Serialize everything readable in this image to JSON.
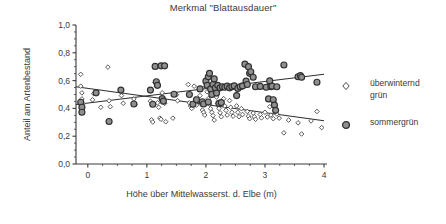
{
  "chart_data": {
    "type": "scatter",
    "title": "Merkmal \"Blattausdauer\"",
    "xlabel": "Höhe über Mittelwasserst. d. Elbe (m)",
    "ylabel": "Anteil am Artenbestand",
    "xlim": [
      -0.2,
      4.05
    ],
    "ylim": [
      0.0,
      1.0
    ],
    "xticks": [
      0,
      1,
      2,
      3,
      4
    ],
    "xtick_labels": [
      "0",
      "1",
      "2",
      "3",
      "4"
    ],
    "yticks": [
      0.0,
      0.2,
      0.4,
      0.6,
      0.8,
      1.0
    ],
    "ytick_labels": [
      "0,0",
      "0,2",
      "0,4",
      "0,6",
      "0,8",
      "1,0"
    ],
    "x_minor_step": 0.25,
    "y_minor_step": 0.05,
    "grid": false,
    "legend_position": "right",
    "series": [
      {
        "name": "überwinternd grün",
        "marker": "open-diamond",
        "marker_size": 4.2,
        "color": "#ffffff",
        "edge_color": "#4a4a4a",
        "trend": {
          "x0": -0.2,
          "y0": 0.556,
          "x1": 4.0,
          "y1": 0.311
        },
        "points": [
          [
            -0.12,
            0.645
          ],
          [
            -0.12,
            0.56
          ],
          [
            -0.1,
            0.512
          ],
          [
            -0.1,
            0.468
          ],
          [
            -0.08,
            0.432
          ],
          [
            0.08,
            0.462
          ],
          [
            0.1,
            0.506
          ],
          [
            0.34,
            0.697
          ],
          [
            0.36,
            0.455
          ],
          [
            0.38,
            0.412
          ],
          [
            0.57,
            0.492
          ],
          [
            0.6,
            0.437
          ],
          [
            0.78,
            0.468
          ],
          [
            0.8,
            0.43
          ],
          [
            1.06,
            0.452
          ],
          [
            1.08,
            0.318
          ],
          [
            1.1,
            0.302
          ],
          [
            1.14,
            0.585
          ],
          [
            1.16,
            0.56
          ],
          [
            1.18,
            0.44
          ],
          [
            1.2,
            0.408
          ],
          [
            1.22,
            0.33
          ],
          [
            1.24,
            0.322
          ],
          [
            1.26,
            0.512
          ],
          [
            1.28,
            0.47
          ],
          [
            1.3,
            0.436
          ],
          [
            1.32,
            0.304
          ],
          [
            1.5,
            0.498
          ],
          [
            1.52,
            0.455
          ],
          [
            1.7,
            0.572
          ],
          [
            1.72,
            0.44
          ],
          [
            1.74,
            0.418
          ],
          [
            1.76,
            0.4
          ],
          [
            1.8,
            0.56
          ],
          [
            1.82,
            0.468
          ],
          [
            1.84,
            0.424
          ],
          [
            1.9,
            0.492
          ],
          [
            1.92,
            0.43
          ],
          [
            1.94,
            0.388
          ],
          [
            1.96,
            0.372
          ],
          [
            1.98,
            0.352
          ],
          [
            2.0,
            0.556
          ],
          [
            2.02,
            0.52
          ],
          [
            2.04,
            0.47
          ],
          [
            2.06,
            0.43
          ],
          [
            2.08,
            0.398
          ],
          [
            2.1,
            0.372
          ],
          [
            2.12,
            0.348
          ],
          [
            2.14,
            0.316
          ],
          [
            2.16,
            0.54
          ],
          [
            2.18,
            0.482
          ],
          [
            2.2,
            0.436
          ],
          [
            2.22,
            0.4
          ],
          [
            2.24,
            0.368
          ],
          [
            2.26,
            0.34
          ],
          [
            2.3,
            0.47
          ],
          [
            2.32,
            0.418
          ],
          [
            2.34,
            0.386
          ],
          [
            2.36,
            0.352
          ],
          [
            2.4,
            0.456
          ],
          [
            2.42,
            0.408
          ],
          [
            2.44,
            0.372
          ],
          [
            2.46,
            0.344
          ],
          [
            2.52,
            0.418
          ],
          [
            2.54,
            0.372
          ],
          [
            2.56,
            0.34
          ],
          [
            2.6,
            0.398
          ],
          [
            2.62,
            0.356
          ],
          [
            2.7,
            0.378
          ],
          [
            2.72,
            0.344
          ],
          [
            2.74,
            0.326
          ],
          [
            2.8,
            0.366
          ],
          [
            2.82,
            0.34
          ],
          [
            2.84,
            0.322
          ],
          [
            2.92,
            0.356
          ],
          [
            2.94,
            0.332
          ],
          [
            3.0,
            0.372
          ],
          [
            3.04,
            0.338
          ],
          [
            3.08,
            0.412
          ],
          [
            3.1,
            0.352
          ],
          [
            3.14,
            0.326
          ],
          [
            3.2,
            0.36
          ],
          [
            3.24,
            0.33
          ],
          [
            3.32,
            0.224
          ],
          [
            3.4,
            0.316
          ],
          [
            3.56,
            0.296
          ],
          [
            3.62,
            0.216
          ],
          [
            3.78,
            0.31
          ],
          [
            3.88,
            0.378
          ],
          [
            3.96,
            0.262
          ],
          [
            0.22,
            0.408
          ],
          [
            1.44,
            0.33
          ]
        ]
      },
      {
        "name": "sommergrün",
        "marker": "filled-circle",
        "marker_size": 6.0,
        "color": "#8f8f8f",
        "edge_color": "#2f2f2f",
        "trend": {
          "x0": -0.2,
          "y0": 0.428,
          "x1": 4.0,
          "y1": 0.645
        },
        "points": [
          [
            -0.12,
            0.444
          ],
          [
            -0.1,
            0.408
          ],
          [
            -0.1,
            0.372
          ],
          [
            0.14,
            0.512
          ],
          [
            0.36,
            0.306
          ],
          [
            0.56,
            0.532
          ],
          [
            0.78,
            0.432
          ],
          [
            1.06,
            0.532
          ],
          [
            1.14,
            0.702
          ],
          [
            1.16,
            0.592
          ],
          [
            1.18,
            0.566
          ],
          [
            1.24,
            0.706
          ],
          [
            1.3,
            0.706
          ],
          [
            1.26,
            0.47
          ],
          [
            1.28,
            0.452
          ],
          [
            1.1,
            0.43
          ],
          [
            1.46,
            0.502
          ],
          [
            1.72,
            0.5
          ],
          [
            1.78,
            0.43
          ],
          [
            1.84,
            0.462
          ],
          [
            1.9,
            0.54
          ],
          [
            1.94,
            0.448
          ],
          [
            2.0,
            0.596
          ],
          [
            2.02,
            0.566
          ],
          [
            2.04,
            0.628
          ],
          [
            2.06,
            0.652
          ],
          [
            2.08,
            0.54
          ],
          [
            2.1,
            0.5
          ],
          [
            2.12,
            0.572
          ],
          [
            2.14,
            0.612
          ],
          [
            2.16,
            0.548
          ],
          [
            2.18,
            0.51
          ],
          [
            2.2,
            0.566
          ],
          [
            2.24,
            0.548
          ],
          [
            2.28,
            0.556
          ],
          [
            2.32,
            0.552
          ],
          [
            2.36,
            0.56
          ],
          [
            2.4,
            0.548
          ],
          [
            2.44,
            0.556
          ],
          [
            2.48,
            0.562
          ],
          [
            2.52,
            0.492
          ],
          [
            2.54,
            0.544
          ],
          [
            2.58,
            0.556
          ],
          [
            2.62,
            0.562
          ],
          [
            2.66,
            0.718
          ],
          [
            2.68,
            0.596
          ],
          [
            2.7,
            0.572
          ],
          [
            2.72,
            0.7
          ],
          [
            2.74,
            0.652
          ],
          [
            2.76,
            0.664
          ],
          [
            2.8,
            0.624
          ],
          [
            2.84,
            0.556
          ],
          [
            2.92,
            0.558
          ],
          [
            3.02,
            0.552
          ],
          [
            3.06,
            0.468
          ],
          [
            3.08,
            0.598
          ],
          [
            3.1,
            0.556
          ],
          [
            3.12,
            0.56
          ],
          [
            3.14,
            0.462
          ],
          [
            3.16,
            0.424
          ],
          [
            3.18,
            0.386
          ],
          [
            3.2,
            0.556
          ],
          [
            3.32,
            0.712
          ],
          [
            3.56,
            0.628
          ],
          [
            3.6,
            0.636
          ],
          [
            3.62,
            0.624
          ],
          [
            3.88,
            0.588
          ],
          [
            1.96,
            0.432
          ],
          [
            2.22,
            0.436
          ],
          [
            2.26,
            0.442
          ],
          [
            2.04,
            0.446
          ]
        ]
      }
    ]
  },
  "legend": {
    "items": [
      {
        "label": "überwinternd",
        "label2": "grün",
        "marker": "open-diamond"
      },
      {
        "label": "sommergrün",
        "label2": "",
        "marker": "filled-circle"
      }
    ]
  },
  "colors": {
    "axis": "#3a3a3a",
    "text": "#3a3a3a",
    "sommergruen_fill": "#8f8f8f",
    "sommergruen_edge": "#2f2f2f",
    "ueberwinternd_edge": "#4a4a4a",
    "trendline": "#2f2f2f",
    "background": "#ffffff"
  }
}
